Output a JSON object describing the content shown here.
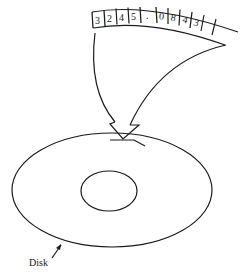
{
  "diagram": {
    "tape": {
      "cells": [
        "3",
        "2",
        "4",
        "5",
        ".",
        "0",
        "8",
        "4",
        "3",
        ""
      ]
    },
    "disk_label": "Disk",
    "colors": {
      "stroke": "#1a1a1a",
      "background": "#ffffff"
    }
  }
}
